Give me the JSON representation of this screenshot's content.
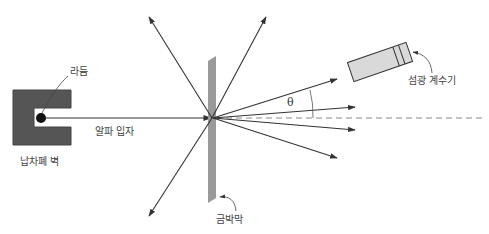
{
  "diagram": {
    "labels": {
      "radium": "라듐",
      "lead_shield": "납차폐 벽",
      "alpha_particles": "알파 입자",
      "gold_foil": "금박막",
      "scintillation_counter": "섬광 계수기",
      "angle": "θ"
    },
    "colors": {
      "lead_block": "#555555",
      "foil": "#9a9a9a",
      "detector_fill": "#d9d9d9",
      "line": "#333333",
      "dashed_axis": "#888888",
      "text": "#444444"
    }
  }
}
